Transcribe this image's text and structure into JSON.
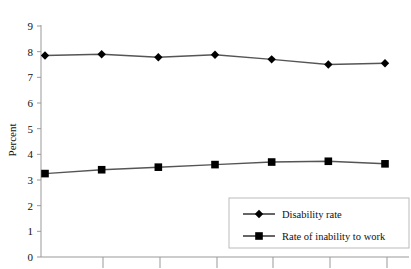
{
  "chart_data": {
    "type": "line",
    "title": "",
    "xlabel": "",
    "ylabel": "Percent",
    "ylim": [
      0,
      9
    ],
    "yticks": [
      0,
      1,
      2,
      3,
      4,
      5,
      6,
      7,
      8,
      9
    ],
    "ytick_labels": [
      "0",
      "1",
      "2",
      "3",
      "4",
      "5",
      "6",
      "7",
      "8",
      "9"
    ],
    "x": [
      1,
      2,
      3,
      4,
      5,
      6,
      7
    ],
    "xtick_labels": [
      "",
      "",
      "",
      "",
      "",
      "",
      ""
    ],
    "grid": false,
    "legend_position": "bottom-right",
    "series": [
      {
        "name": "Disability rate",
        "marker": "diamond",
        "color": "#000000",
        "line_color": "#555555",
        "values": [
          7.85,
          7.9,
          7.78,
          7.88,
          7.7,
          7.5,
          7.55
        ]
      },
      {
        "name": "Rate of inability to work",
        "marker": "square",
        "color": "#000000",
        "line_color": "#555555",
        "values": [
          3.25,
          3.4,
          3.5,
          3.6,
          3.7,
          3.73,
          3.63
        ]
      }
    ]
  },
  "axes": {
    "y_axis_title": "Percent"
  },
  "legend": {
    "entries": [
      {
        "label": "Disability rate",
        "marker": "diamond-marker-icon"
      },
      {
        "label": "Rate of inability to work",
        "marker": "square-marker-icon"
      }
    ]
  },
  "colors": {
    "background": "#ffffff",
    "marker": "#000000",
    "line": "#555555",
    "axis": "#999999",
    "legend_border": "#bbbbbb",
    "text": "#111111"
  }
}
